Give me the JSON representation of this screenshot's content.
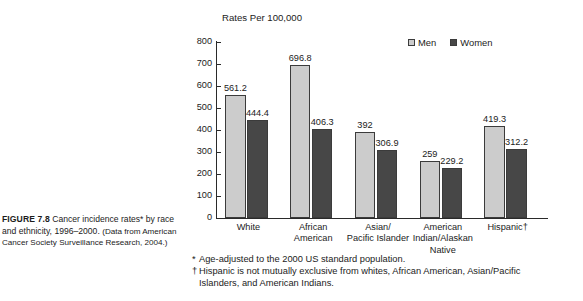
{
  "figure": {
    "label": "FIGURE 7.8",
    "caption_main": "Cancer incidence rates* by race and ethnicity, 1996–2000.",
    "caption_source": "(Data from American Cancer Society Surveillance Research, 2004.)"
  },
  "chart_data": {
    "type": "bar",
    "title": "Rates Per 100,000",
    "xlabel": "",
    "ylabel": "Rates Per 100,000",
    "ylim": [
      0,
      800
    ],
    "ytick_step": 100,
    "yticks": [
      "0",
      "100",
      "200",
      "300",
      "400",
      "500",
      "600",
      "700",
      "800"
    ],
    "grid": false,
    "legend_position": "top-right",
    "categories": [
      "White",
      "African American",
      "Asian/ Pacific Islander",
      "American Indian/Alaskan Native",
      "Hispanic†"
    ],
    "category_lines": [
      [
        "White"
      ],
      [
        "African",
        "American"
      ],
      [
        "Asian/",
        "Pacific Islander"
      ],
      [
        "American",
        "Indian/Alaskan",
        "Native"
      ],
      [
        "Hispanic†"
      ]
    ],
    "series": [
      {
        "name": "Men",
        "color": "#cccccc",
        "values": [
          561.2,
          696.8,
          392,
          259,
          419.3
        ],
        "labels": [
          "561.2",
          "696.8",
          "392",
          "259",
          "419.3"
        ]
      },
      {
        "name": "Women",
        "color": "#474747",
        "values": [
          444.4,
          406.3,
          306.9,
          229.2,
          312.2
        ],
        "labels": [
          "444.4",
          "406.3",
          "306.9",
          "229.2",
          "312.2"
        ]
      }
    ]
  },
  "legend": {
    "items": [
      {
        "label": "Men",
        "color": "#cccccc"
      },
      {
        "label": "Women",
        "color": "#474747"
      }
    ]
  },
  "footnotes": {
    "asterisk_mark": "*",
    "asterisk_text": "Age-adjusted to the 2000 US standard population.",
    "dagger_mark": "†",
    "dagger_text_line1": "Hispanic is not mutually exclusive from whites, African American, Asian/Pacific",
    "dagger_text_line2": "Islanders, and American Indians."
  }
}
